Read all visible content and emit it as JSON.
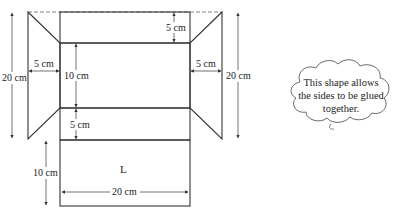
{
  "diagram": {
    "type": "net of box with glue flaps",
    "panels": [
      {
        "id": "top-flap",
        "height_label": "5 cm"
      },
      {
        "id": "middle-panel",
        "height_label": "10 cm"
      },
      {
        "id": "lower-strip",
        "height_label": "5 cm"
      },
      {
        "id": "base-panel",
        "label": "L",
        "height_label": "10 cm",
        "width_label": "20 cm"
      }
    ],
    "side_flaps": [
      {
        "id": "left-flap",
        "width_label": "5 cm"
      },
      {
        "id": "right-flap",
        "width_label": "5 cm"
      }
    ],
    "left_height_label": "20 cm",
    "right_height_label": "20 cm"
  },
  "labels": {
    "top_5cm": "5 cm",
    "middle_10cm": "10 cm",
    "lower_5cm": "5 cm",
    "left_flap_5cm": "5 cm",
    "right_flap_5cm": "5 cm",
    "left_20cm": "20 cm",
    "right_20cm": "20 cm",
    "base_10cm": "10 cm",
    "base_20cm": "20 cm",
    "base_letter": "L"
  },
  "callout": {
    "line1": "This shape allows",
    "line2": "the sides to be glued",
    "line3": "together."
  },
  "colors": {
    "stroke": "#333333",
    "hatch": "#555555",
    "background": "#ffffff"
  }
}
